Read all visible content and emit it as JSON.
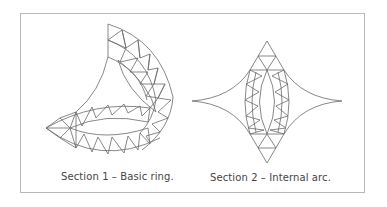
{
  "figure": {
    "sections": [
      {
        "id": "section-1",
        "caption": "Section 1 – Basic ring."
      },
      {
        "id": "section-2",
        "caption": "Section 2 – Internal arc."
      }
    ],
    "line_color": "#6a6a6a",
    "border_color": "#b9b9b9"
  }
}
